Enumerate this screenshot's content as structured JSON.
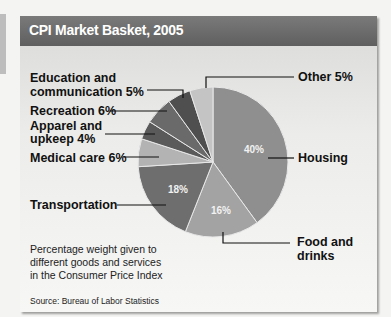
{
  "chart_data": {
    "type": "pie",
    "title": "CPI Market Basket, 2005",
    "categories": [
      "Housing",
      "Food and drinks",
      "Transportation",
      "Medical care",
      "Apparel and upkeep",
      "Recreation",
      "Education and communication",
      "Other"
    ],
    "values": [
      40,
      16,
      18,
      6,
      4,
      6,
      5,
      5
    ],
    "unit": "%",
    "start_angle": "12 o'clock, clockwise",
    "colors": [
      "#8f8f8f",
      "#a3a3a3",
      "#6e6e6e",
      "#b3b3b3",
      "#5a5a5a",
      "#6a6a6a",
      "#4f4f4f",
      "#c4c4c4"
    ],
    "inner_labels": [
      "40%",
      "16%",
      "18%"
    ],
    "annotation": "Percentage weight given to different goods and services in the Consumer Price Index",
    "source": "Source: Bureau of Labor Statistics"
  },
  "header": {
    "title": "CPI Market Basket, 2005"
  },
  "labels": {
    "education_line1": "Education and",
    "education_line2": "communication 5%",
    "recreation": "Recreation 6%",
    "apparel_line1": "Apparel and",
    "apparel_line2": "upkeep 4%",
    "medical": "Medical care 6%",
    "transportation": "Transportation",
    "other": "Other 5%",
    "housing": "Housing",
    "food_line1": "Food and",
    "food_line2": "drinks"
  },
  "inner": {
    "housing": "40%",
    "food": "16%",
    "transportation": "18%"
  },
  "note": {
    "line1": "Percentage weight given to",
    "line2": "different goods and services",
    "line3": "in the Consumer Price Index"
  },
  "source": "Source: Bureau of Labor Statistics"
}
